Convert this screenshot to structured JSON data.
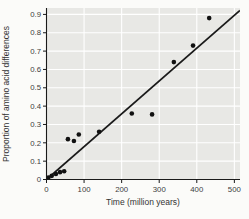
{
  "figure": {
    "background": "#fbfbf9"
  },
  "chart_data": {
    "type": "scatter",
    "title": "",
    "xlabel": "Time (million years)",
    "ylabel": "Proportion of amino acid differences",
    "xlim": [
      0,
      515
    ],
    "ylim": [
      0,
      0.935
    ],
    "grid": true,
    "legend": "none",
    "plot_bg": "#e8e8e5",
    "grid_color": "#ffffff",
    "axis_color": "#1a1a1a",
    "point_color": "#111111",
    "trend_color": "#1a1a1a",
    "xticks": [
      {
        "value": 0,
        "label": "0"
      },
      {
        "value": 100,
        "label": "100"
      },
      {
        "value": 200,
        "label": "200"
      },
      {
        "value": 300,
        "label": "300"
      },
      {
        "value": 400,
        "label": "400"
      },
      {
        "value": 500,
        "label": "500"
      }
    ],
    "yticks": [
      {
        "value": 0.0,
        "label": "0"
      },
      {
        "value": 0.1,
        "label": "0.1"
      },
      {
        "value": 0.2,
        "label": "0.2"
      },
      {
        "value": 0.3,
        "label": "0.3"
      },
      {
        "value": 0.4,
        "label": "0.4"
      },
      {
        "value": 0.5,
        "label": "0.5"
      },
      {
        "value": 0.6,
        "label": "0.6"
      },
      {
        "value": 0.7,
        "label": "0.7"
      },
      {
        "value": 0.8,
        "label": "0.8"
      },
      {
        "value": 0.9,
        "label": "0.9"
      }
    ],
    "points": [
      [
        5,
        0.01
      ],
      [
        14,
        0.02
      ],
      [
        25,
        0.03
      ],
      [
        36,
        0.04
      ],
      [
        47,
        0.045
      ],
      [
        57,
        0.22
      ],
      [
        73,
        0.21
      ],
      [
        86,
        0.245
      ],
      [
        140,
        0.26
      ],
      [
        227,
        0.36
      ],
      [
        281,
        0.355
      ],
      [
        339,
        0.64
      ],
      [
        390,
        0.73
      ],
      [
        433,
        0.88
      ]
    ],
    "trendline": {
      "x1": 0,
      "y1": 0,
      "x2": 515,
      "y2": 0.922
    }
  }
}
